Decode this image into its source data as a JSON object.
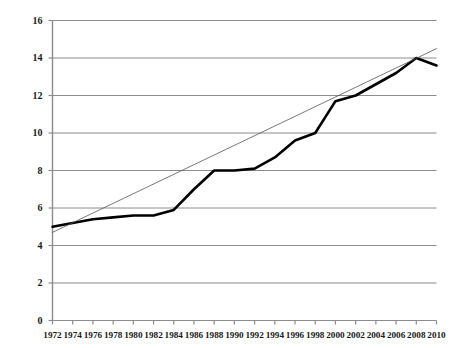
{
  "chart_data": {
    "type": "line",
    "title": "",
    "xlabel": "",
    "ylabel": "",
    "xlim": [
      1972,
      2010
    ],
    "ylim": [
      0,
      16
    ],
    "grid": true,
    "legend": "none",
    "y_ticks": [
      0,
      2,
      4,
      6,
      8,
      10,
      12,
      14,
      16
    ],
    "x_ticks": [
      1972,
      1974,
      1976,
      1978,
      1980,
      1982,
      1984,
      1986,
      1988,
      1990,
      1992,
      1994,
      1996,
      1998,
      2000,
      2002,
      2004,
      2006,
      2008,
      2010
    ],
    "x_tick_labels": [
      "1972",
      "1974",
      "1976",
      "1978",
      "1980",
      "1982",
      "1984",
      "1986",
      "1988",
      "1990",
      "1992",
      "1994",
      "1996",
      "1998",
      "2000",
      "2002",
      "2004",
      "2006",
      "2008",
      "2010"
    ],
    "y_tick_labels": [
      "0",
      "2",
      "4",
      "6",
      "8",
      "10",
      "12",
      "14",
      "16"
    ],
    "series": [
      {
        "name": "data",
        "color": "#000000",
        "linewidth": 2.6,
        "style": "solid",
        "x": [
          1972,
          1974,
          1976,
          1978,
          1980,
          1982,
          1984,
          1986,
          1988,
          1990,
          1992,
          1994,
          1996,
          1998,
          2000,
          2002,
          2004,
          2006,
          2008,
          2010
        ],
        "values": [
          5.0,
          5.2,
          5.4,
          5.5,
          5.6,
          5.6,
          5.9,
          7.0,
          8.0,
          8.0,
          8.1,
          8.7,
          9.6,
          10.0,
          11.7,
          12.0,
          12.6,
          13.2,
          14.0,
          13.6
        ]
      },
      {
        "name": "trendline",
        "color": "#555555",
        "linewidth": 0.8,
        "style": "solid",
        "x": [
          1972,
          2010
        ],
        "values": [
          4.7,
          14.5
        ]
      }
    ]
  },
  "axes": {
    "y_axis_name": "y-axis",
    "x_axis_name": "x-axis"
  }
}
